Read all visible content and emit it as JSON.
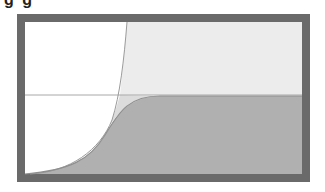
{
  "heading": {
    "text": "g g",
    "note": "clipped, only bottoms of glyphs visible"
  },
  "diagram": {
    "type": "growth-curves",
    "frame": {
      "x": 17,
      "y": 14,
      "width": 293,
      "height": 168,
      "border_width": 8,
      "border_color": "#6a6a6a"
    },
    "colors": {
      "background_left": "#ffffff",
      "region_upper_right": "#ececec",
      "region_under_s_curve": "#b0b0b0",
      "curve_stroke": "#9a9a9a",
      "carrying_capacity_line": "#a8a8a8"
    },
    "carrying_capacity_y": 95,
    "curves": [
      {
        "name": "exponential-curve",
        "description": "thin steep curve rising to top"
      },
      {
        "name": "logistic-s-curve",
        "description": "sigmoid curve leveling at horizontal line"
      }
    ]
  }
}
